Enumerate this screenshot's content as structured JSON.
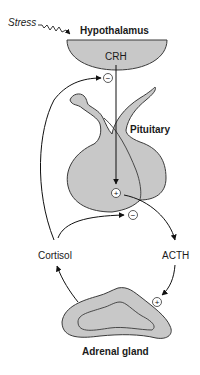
{
  "diagram": {
    "colors": {
      "organ_fill": "#c8c8c8",
      "outline": "#3a3a3a",
      "arrow": "#111111",
      "background": "#ffffff"
    },
    "nodes": {
      "stress": "Stress",
      "hypothalamus": "Hypothalamus",
      "crh": "CRH",
      "pituitary": "Pituitary",
      "cortisol": "Cortisol",
      "acth": "ACTH",
      "adrenal": "Adrenal gland"
    },
    "signs": {
      "inhibit_hypothalamus": "−",
      "stimulate_pituitary": "+",
      "inhibit_pituitary": "−",
      "stimulate_adrenal": "+"
    },
    "edges": [
      {
        "from": "Stress",
        "to": "Hypothalamus",
        "style": "zigzag"
      },
      {
        "from": "Hypothalamus",
        "to": "Pituitary",
        "label": "CRH",
        "sign": "+"
      },
      {
        "from": "Pituitary",
        "to": "Adrenal gland",
        "label": "ACTH",
        "sign": "+"
      },
      {
        "from": "Adrenal gland",
        "to": "Pituitary",
        "label": "Cortisol",
        "sign": "−"
      },
      {
        "from": "Adrenal gland",
        "to": "Hypothalamus",
        "label": "Cortisol",
        "sign": "−"
      }
    ]
  }
}
